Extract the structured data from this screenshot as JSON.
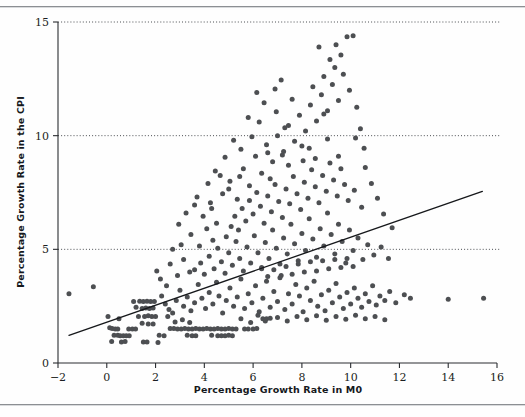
{
  "figure": {
    "background_color": "#fefefe",
    "rules": [
      "top-rule",
      "bottom-rule"
    ]
  },
  "chart_data": {
    "type": "scatter",
    "title": "",
    "xlabel": "Percentage Growth Rate in M0",
    "ylabel": "Percentage Growth Rate in the CPI",
    "xlim": [
      -2,
      16
    ],
    "ylim": [
      0,
      15
    ],
    "xticks": [
      -2,
      0,
      2,
      4,
      6,
      8,
      10,
      12,
      14,
      16
    ],
    "xtick_labels": [
      "−2",
      "0",
      "2",
      "4",
      "6",
      "8",
      "10",
      "12",
      "14",
      "16"
    ],
    "yticks": [
      0,
      5,
      10,
      15
    ],
    "ytick_labels": [
      "0",
      "5",
      "10",
      "15"
    ],
    "grid": "horizontal dotted gridlines at y = 5, 10, 15",
    "legend": "none",
    "marker_color": "#4d4f52",
    "marker_size_px": 5,
    "fit_line": {
      "label": "least-squares regression line",
      "color": "#16181b",
      "x_start": -1.55,
      "y_start": 1.22,
      "x_end": 15.4,
      "y_end": 7.55,
      "slope": 0.373,
      "intercept": 1.8
    },
    "points": [
      [
        -1.55,
        3.05
      ],
      [
        -0.55,
        3.35
      ],
      [
        0.05,
        2.05
      ],
      [
        0.12,
        1.55
      ],
      [
        0.22,
        1.52
      ],
      [
        0.35,
        1.5
      ],
      [
        0.45,
        1.5
      ],
      [
        0.5,
        1.95
      ],
      [
        0.55,
        1.2
      ],
      [
        0.68,
        1.2
      ],
      [
        0.8,
        1.2
      ],
      [
        0.92,
        1.2
      ],
      [
        0.6,
        0.92
      ],
      [
        0.75,
        0.95
      ],
      [
        0.3,
        1.22
      ],
      [
        0.45,
        1.22
      ],
      [
        0.2,
        0.95
      ],
      [
        0.9,
        1.5
      ],
      [
        1.05,
        1.5
      ],
      [
        1.18,
        1.5
      ],
      [
        1.5,
        0.92
      ],
      [
        1.65,
        0.92
      ],
      [
        2.1,
        0.9
      ],
      [
        2.15,
        1.22
      ],
      [
        2.35,
        1.2
      ],
      [
        2.6,
        1.52
      ],
      [
        2.75,
        1.52
      ],
      [
        2.9,
        1.5
      ],
      [
        3.05,
        1.5
      ],
      [
        3.2,
        1.52
      ],
      [
        3.35,
        1.5
      ],
      [
        3.5,
        1.5
      ],
      [
        3.65,
        1.52
      ],
      [
        3.8,
        1.5
      ],
      [
        3.95,
        1.5
      ],
      [
        4.1,
        1.52
      ],
      [
        4.25,
        1.5
      ],
      [
        4.4,
        1.5
      ],
      [
        4.55,
        1.52
      ],
      [
        4.7,
        1.5
      ],
      [
        4.85,
        1.5
      ],
      [
        5.0,
        1.52
      ],
      [
        5.15,
        1.5
      ],
      [
        5.3,
        1.5
      ],
      [
        3.3,
        1.22
      ],
      [
        3.5,
        1.2
      ],
      [
        3.65,
        1.2
      ],
      [
        4.3,
        1.22
      ],
      [
        4.55,
        1.2
      ],
      [
        4.7,
        1.2
      ],
      [
        4.85,
        1.2
      ],
      [
        5.0,
        1.22
      ],
      [
        5.15,
        1.2
      ],
      [
        5.65,
        1.5
      ],
      [
        5.8,
        1.5
      ],
      [
        6.0,
        1.5
      ],
      [
        6.15,
        1.52
      ],
      [
        6.4,
        1.95
      ],
      [
        6.55,
        1.95
      ],
      [
        6.7,
        1.97
      ],
      [
        1.1,
        2.7
      ],
      [
        1.35,
        2.72
      ],
      [
        1.5,
        2.7
      ],
      [
        1.65,
        2.72
      ],
      [
        1.8,
        2.7
      ],
      [
        1.95,
        2.7
      ],
      [
        1.2,
        2.45
      ],
      [
        1.45,
        2.4
      ],
      [
        1.6,
        2.42
      ],
      [
        1.75,
        2.4
      ],
      [
        1.9,
        2.42
      ],
      [
        1.3,
        2.05
      ],
      [
        1.55,
        2.05
      ],
      [
        1.7,
        2.08
      ],
      [
        1.85,
        2.05
      ],
      [
        2.0,
        2.05
      ],
      [
        1.45,
        1.75
      ],
      [
        1.7,
        1.72
      ],
      [
        1.9,
        1.72
      ],
      [
        2.25,
        2.95
      ],
      [
        2.4,
        2.6
      ],
      [
        2.55,
        2.35
      ],
      [
        2.7,
        2.2
      ],
      [
        2.85,
        2.75
      ],
      [
        3.0,
        3.2
      ],
      [
        3.15,
        2.5
      ],
      [
        3.3,
        2.9
      ],
      [
        3.45,
        2.3
      ],
      [
        3.6,
        2.65
      ],
      [
        3.75,
        3.45
      ],
      [
        3.9,
        2.85
      ],
      [
        4.05,
        2.4
      ],
      [
        4.2,
        3.1
      ],
      [
        4.35,
        2.6
      ],
      [
        4.5,
        3.55
      ],
      [
        4.6,
        2.95
      ],
      [
        4.75,
        2.2
      ],
      [
        4.9,
        2.75
      ],
      [
        5.05,
        3.3
      ],
      [
        5.2,
        2.5
      ],
      [
        5.35,
        2.9
      ],
      [
        5.5,
        3.7
      ],
      [
        5.65,
        2.4
      ],
      [
        5.8,
        3.05
      ],
      [
        5.95,
        2.65
      ],
      [
        6.1,
        3.4
      ],
      [
        6.25,
        2.25
      ],
      [
        6.4,
        2.85
      ],
      [
        6.55,
        3.6
      ],
      [
        6.7,
        2.45
      ],
      [
        6.85,
        3.15
      ],
      [
        7.0,
        2.7
      ],
      [
        7.15,
        3.85
      ],
      [
        7.3,
        2.35
      ],
      [
        7.45,
        3.05
      ],
      [
        7.6,
        2.6
      ],
      [
        7.75,
        3.45
      ],
      [
        7.9,
        2.95
      ],
      [
        8.05,
        2.25
      ],
      [
        8.2,
        3.3
      ],
      [
        8.35,
        2.75
      ],
      [
        8.5,
        3.6
      ],
      [
        8.65,
        2.5
      ],
      [
        8.8,
        3.0
      ],
      [
        8.95,
        2.3
      ],
      [
        9.1,
        3.2
      ],
      [
        9.25,
        2.65
      ],
      [
        9.4,
        3.5
      ],
      [
        9.55,
        2.9
      ],
      [
        9.7,
        2.4
      ],
      [
        9.85,
        3.1
      ],
      [
        10.0,
        2.6
      ],
      [
        10.15,
        3.3
      ],
      [
        10.3,
        2.85
      ],
      [
        10.45,
        2.45
      ],
      [
        10.6,
        3.05
      ],
      [
        10.75,
        2.7
      ],
      [
        10.9,
        3.4
      ],
      [
        11.05,
        2.55
      ],
      [
        11.2,
        2.95
      ],
      [
        11.4,
        2.75
      ],
      [
        11.6,
        3.15
      ],
      [
        11.85,
        2.65
      ],
      [
        3.6,
        4.1
      ],
      [
        3.85,
        4.4
      ],
      [
        4.0,
        3.9
      ],
      [
        4.2,
        4.7
      ],
      [
        4.4,
        4.15
      ],
      [
        4.55,
        5.05
      ],
      [
        4.7,
        4.45
      ],
      [
        4.85,
        3.95
      ],
      [
        5.0,
        4.85
      ],
      [
        5.15,
        4.3
      ],
      [
        5.3,
        5.35
      ],
      [
        5.45,
        4.6
      ],
      [
        5.6,
        4.05
      ],
      [
        5.75,
        5.1
      ],
      [
        5.9,
        4.4
      ],
      [
        6.05,
        5.6
      ],
      [
        6.2,
        4.85
      ],
      [
        6.35,
        4.2
      ],
      [
        6.5,
        5.3
      ],
      [
        6.65,
        4.6
      ],
      [
        6.8,
        5.85
      ],
      [
        6.95,
        5.05
      ],
      [
        7.1,
        4.35
      ],
      [
        7.25,
        5.5
      ],
      [
        7.4,
        4.8
      ],
      [
        7.55,
        6.1
      ],
      [
        7.7,
        5.25
      ],
      [
        7.85,
        4.5
      ],
      [
        8.0,
        5.7
      ],
      [
        8.15,
        4.95
      ],
      [
        8.3,
        6.35
      ],
      [
        8.45,
        5.45
      ],
      [
        8.6,
        4.65
      ],
      [
        8.75,
        5.9
      ],
      [
        8.9,
        5.15
      ],
      [
        9.05,
        6.6
      ],
      [
        9.2,
        5.65
      ],
      [
        9.35,
        4.8
      ],
      [
        9.5,
        6.1
      ],
      [
        9.65,
        5.35
      ],
      [
        9.8,
        4.4
      ],
      [
        9.95,
        5.85
      ],
      [
        10.1,
        4.95
      ],
      [
        10.3,
        5.5
      ],
      [
        10.5,
        4.55
      ],
      [
        10.7,
        5.2
      ],
      [
        10.95,
        4.75
      ],
      [
        11.25,
        5.1
      ],
      [
        11.55,
        4.6
      ],
      [
        4.9,
        5.55
      ],
      [
        5.1,
        6.0
      ],
      [
        5.25,
        6.45
      ],
      [
        5.4,
        5.85
      ],
      [
        5.55,
        6.8
      ],
      [
        5.7,
        6.25
      ],
      [
        5.85,
        7.15
      ],
      [
        6.0,
        6.55
      ],
      [
        6.15,
        7.5
      ],
      [
        6.3,
        6.9
      ],
      [
        6.45,
        6.15
      ],
      [
        6.6,
        7.35
      ],
      [
        6.75,
        6.65
      ],
      [
        6.9,
        7.85
      ],
      [
        7.05,
        7.1
      ],
      [
        7.2,
        6.4
      ],
      [
        7.35,
        7.65
      ],
      [
        7.5,
        7.0
      ],
      [
        7.65,
        8.2
      ],
      [
        7.8,
        7.45
      ],
      [
        7.95,
        6.75
      ],
      [
        8.1,
        7.95
      ],
      [
        8.25,
        7.25
      ],
      [
        8.4,
        8.5
      ],
      [
        8.55,
        7.75
      ],
      [
        8.7,
        7.05
      ],
      [
        8.85,
        8.25
      ],
      [
        9.0,
        7.55
      ],
      [
        9.15,
        8.8
      ],
      [
        9.3,
        8.05
      ],
      [
        9.45,
        7.35
      ],
      [
        9.6,
        8.55
      ],
      [
        9.75,
        7.85
      ],
      [
        9.9,
        7.15
      ],
      [
        3.95,
        6.45
      ],
      [
        4.25,
        7.05
      ],
      [
        4.5,
        6.15
      ],
      [
        4.75,
        7.45
      ],
      [
        5.05,
        8.0
      ],
      [
        5.35,
        7.2
      ],
      [
        5.6,
        8.55
      ],
      [
        5.85,
        7.8
      ],
      [
        6.1,
        9.1
      ],
      [
        6.35,
        8.35
      ],
      [
        6.55,
        9.6
      ],
      [
        6.8,
        8.85
      ],
      [
        7.0,
        10.0
      ],
      [
        7.25,
        9.3
      ],
      [
        7.45,
        10.45
      ],
      [
        7.7,
        9.75
      ],
      [
        7.9,
        10.9
      ],
      [
        8.15,
        10.2
      ],
      [
        8.35,
        11.35
      ],
      [
        8.6,
        10.65
      ],
      [
        8.8,
        11.8
      ],
      [
        9.05,
        11.1
      ],
      [
        9.25,
        12.25
      ],
      [
        9.5,
        11.55
      ],
      [
        9.7,
        12.7
      ],
      [
        9.95,
        12.0
      ],
      [
        5.5,
        9.4
      ],
      [
        5.95,
        9.95
      ],
      [
        6.25,
        10.6
      ],
      [
        6.6,
        9.25
      ],
      [
        6.95,
        11.05
      ],
      [
        7.3,
        10.35
      ],
      [
        7.6,
        11.6
      ],
      [
        8.0,
        9.55
      ],
      [
        8.45,
        12.15
      ],
      [
        8.9,
        10.95
      ],
      [
        9.35,
        13.0
      ],
      [
        9.6,
        13.55
      ],
      [
        9.85,
        14.35
      ],
      [
        10.1,
        14.4
      ],
      [
        9.4,
        14.0
      ],
      [
        9.15,
        13.35
      ],
      [
        8.9,
        12.6
      ],
      [
        8.7,
        13.9
      ],
      [
        10.25,
        11.25
      ],
      [
        10.4,
        10.3
      ],
      [
        10.55,
        9.45
      ],
      [
        10.2,
        9.9
      ],
      [
        7.15,
        12.45
      ],
      [
        6.9,
        12.05
      ],
      [
        6.45,
        11.45
      ],
      [
        6.15,
        11.9
      ],
      [
        5.8,
        10.8
      ],
      [
        5.2,
        9.8
      ],
      [
        4.85,
        9.05
      ],
      [
        4.45,
        8.45
      ],
      [
        4.15,
        7.9
      ],
      [
        3.7,
        7.3
      ],
      [
        10.6,
        8.6
      ],
      [
        10.85,
        7.9
      ],
      [
        11.1,
        7.25
      ],
      [
        11.35,
        6.55
      ],
      [
        11.7,
        5.95
      ],
      [
        10.45,
        6.85
      ],
      [
        10.15,
        7.6
      ],
      [
        12.2,
        3.0
      ],
      [
        12.45,
        2.85
      ],
      [
        14.0,
        2.8
      ],
      [
        15.45,
        2.85
      ],
      [
        2.45,
        3.4
      ],
      [
        2.2,
        3.7
      ],
      [
        2.05,
        4.05
      ],
      [
        2.6,
        4.35
      ],
      [
        2.9,
        3.85
      ],
      [
        3.15,
        4.55
      ],
      [
        3.4,
        4.0
      ],
      [
        3.05,
        5.2
      ],
      [
        3.45,
        5.65
      ],
      [
        3.8,
        5.15
      ],
      [
        4.1,
        5.9
      ],
      [
        4.35,
        5.4
      ],
      [
        2.7,
        5.0
      ],
      [
        2.95,
        6.1
      ],
      [
        3.25,
        6.6
      ],
      [
        3.6,
        6.95
      ],
      [
        8.05,
        8.9
      ],
      [
        8.3,
        9.45
      ],
      [
        8.55,
        9.0
      ],
      [
        9.05,
        9.85
      ],
      [
        9.5,
        9.1
      ],
      [
        7.45,
        8.7
      ],
      [
        7.2,
        9.15
      ],
      [
        6.7,
        8.1
      ],
      [
        5.45,
        8.2
      ],
      [
        5.0,
        7.65
      ],
      [
        4.65,
        8.25
      ],
      [
        4.3,
        6.8
      ],
      [
        6.85,
        4.1
      ],
      [
        7.1,
        3.75
      ],
      [
        7.35,
        4.25
      ],
      [
        7.6,
        3.9
      ],
      [
        7.85,
        4.35
      ],
      [
        8.1,
        4.0
      ],
      [
        8.35,
        4.45
      ],
      [
        8.6,
        4.05
      ],
      [
        8.85,
        4.5
      ],
      [
        9.1,
        4.15
      ],
      [
        9.35,
        4.55
      ],
      [
        9.6,
        4.2
      ],
      [
        9.85,
        4.6
      ],
      [
        10.1,
        4.25
      ],
      [
        6.6,
        3.8
      ],
      [
        6.35,
        4.15
      ],
      [
        2.5,
        2.05
      ],
      [
        2.8,
        1.8
      ],
      [
        3.1,
        1.9
      ],
      [
        3.4,
        1.78
      ],
      [
        5.5,
        1.95
      ],
      [
        5.9,
        1.78
      ],
      [
        6.2,
        2.1
      ],
      [
        6.5,
        1.85
      ],
      [
        7.0,
        2.0
      ],
      [
        7.4,
        1.85
      ],
      [
        7.8,
        2.05
      ],
      [
        8.2,
        1.9
      ],
      [
        8.6,
        2.08
      ],
      [
        9.0,
        1.88
      ],
      [
        9.4,
        2.05
      ],
      [
        9.8,
        1.92
      ],
      [
        10.2,
        2.1
      ],
      [
        10.6,
        1.95
      ],
      [
        11.0,
        2.05
      ],
      [
        11.4,
        1.9
      ]
    ]
  }
}
